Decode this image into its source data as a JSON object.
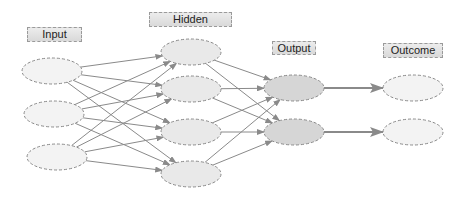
{
  "diagram": {
    "type": "neural-network",
    "colors": {
      "edge": "#8a8a8a",
      "node_border": "#8a8a8a",
      "input_fill": "#f3f3f3",
      "hidden_fill": "#e9e9e9",
      "output_fill": "#d6d6d6",
      "outcome_fill": "#f3f3f3"
    },
    "layers": [
      {
        "id": "input",
        "label": "Input",
        "label_box": {
          "x": 27,
          "y": 27,
          "w": 55,
          "h": 15
        },
        "nodes": [
          {
            "cx": 52,
            "cy": 71
          },
          {
            "cx": 54,
            "cy": 114
          },
          {
            "cx": 57,
            "cy": 157
          }
        ]
      },
      {
        "id": "hidden",
        "label": "Hidden",
        "label_box": {
          "x": 149,
          "y": 12,
          "w": 83,
          "h": 15
        },
        "nodes": [
          {
            "cx": 191,
            "cy": 52
          },
          {
            "cx": 191,
            "cy": 89
          },
          {
            "cx": 191,
            "cy": 132
          },
          {
            "cx": 191,
            "cy": 174
          }
        ]
      },
      {
        "id": "output",
        "label": "Output",
        "label_box": {
          "x": 272,
          "y": 41,
          "w": 44,
          "h": 14
        },
        "nodes": [
          {
            "cx": 294,
            "cy": 88
          },
          {
            "cx": 294,
            "cy": 132
          }
        ]
      },
      {
        "id": "outcome",
        "label": "Outcome",
        "label_box": {
          "x": 383,
          "y": 43,
          "w": 60,
          "h": 15
        },
        "nodes": [
          {
            "cx": 413,
            "cy": 88
          },
          {
            "cx": 413,
            "cy": 132
          }
        ]
      }
    ],
    "connections": [
      {
        "from": "input",
        "to": "hidden",
        "pattern": "fully-connected"
      },
      {
        "from": "hidden",
        "to": "output",
        "pattern": "fully-connected"
      },
      {
        "from": "output",
        "to": "outcome",
        "pattern": "one-to-one",
        "weight": "thick"
      }
    ]
  }
}
